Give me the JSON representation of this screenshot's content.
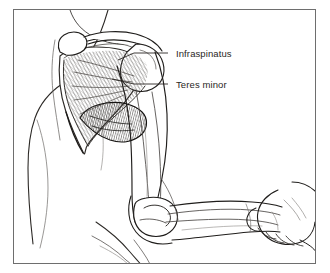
{
  "figure": {
    "style": "black-and-white medical line art with hatched muscle fibers",
    "frame": {
      "border_color": "#6e6e6e",
      "background_color": "#ffffff",
      "x": 13,
      "y": 9,
      "width": 303,
      "height": 255
    },
    "ink_color": "#1c1a18",
    "muscle_fiber_color": "#5d5a57",
    "shadow_color": "#8e8b88"
  },
  "labels": [
    {
      "id": "infraspinatus",
      "text": "Infraspinatus",
      "text_x": 176,
      "text_y": 57,
      "leader": {
        "x1": 168,
        "y1": 53,
        "x2": 134,
        "y2": 53,
        "x3": 118,
        "y3": 60
      }
    },
    {
      "id": "teres-minor",
      "text": "Teres minor",
      "text_x": 176,
      "text_y": 88,
      "leader": {
        "x1": 168,
        "y1": 84,
        "x2": 134,
        "y2": 84,
        "x3": 112,
        "y3": 79
      }
    }
  ],
  "anatomy_parts": [
    {
      "name": "torso",
      "label": "Torso / back"
    },
    {
      "name": "scapula",
      "label": "Scapula"
    },
    {
      "name": "scapular-spine",
      "label": "Spine of scapula"
    },
    {
      "name": "acromion",
      "label": "Acromion"
    },
    {
      "name": "infraspinatus-muscle",
      "label": "Infraspinatus"
    },
    {
      "name": "teres-minor-muscle",
      "label": "Teres minor"
    },
    {
      "name": "humerus",
      "label": "Humerus / upper arm"
    },
    {
      "name": "elbow-joint",
      "label": "Elbow joint"
    },
    {
      "name": "forearm",
      "label": "Forearm"
    },
    {
      "name": "examiner-hand",
      "label": "Examiner's hand"
    }
  ]
}
